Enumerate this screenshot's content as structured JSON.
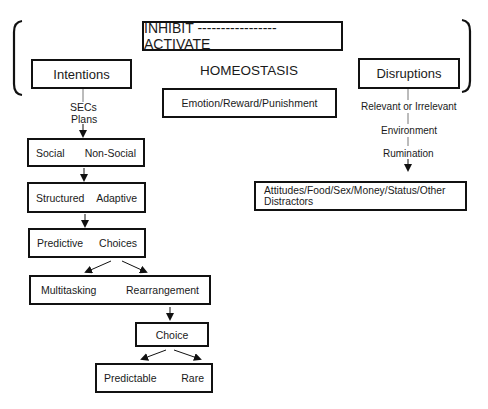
{
  "header": {
    "range_label": "INHIBIT ----------------- ACTIVATE",
    "center_label": "HOMEOSTASIS"
  },
  "left_branch": {
    "title": "Intentions",
    "sub_labels": [
      "SECs",
      "Plans"
    ],
    "boxes": [
      {
        "left": "Social",
        "right": "Non-Social"
      },
      {
        "left": "Structured",
        "right": "Adaptive"
      },
      {
        "left": "Predictive",
        "right": "Choices"
      },
      {
        "left": "Multitasking",
        "right": "Rearrangement"
      }
    ],
    "choice": "Choice",
    "outcome": {
      "left": "Predictable",
      "right": "Rare"
    }
  },
  "center_branch": {
    "title": "Emotion/Reward/Punishment"
  },
  "right_branch": {
    "title": "Disruptions",
    "sub_labels": [
      "Relevant or Irrelevant",
      "Environment",
      "Rumination"
    ],
    "result": "Attitudes/Food/Sex/Money/Status/Other Distractors"
  }
}
